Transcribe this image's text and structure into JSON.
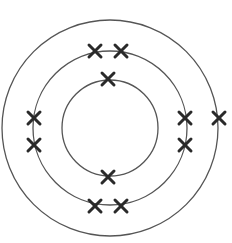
{
  "diagram": {
    "type": "bohr-model",
    "center": {
      "x": 110,
      "y": 128
    },
    "colors": {
      "shell": "#555555",
      "electron": "#2a2a2a",
      "background": "#ffffff"
    },
    "shells": [
      {
        "name": "shell-1",
        "radius": 48,
        "electron_count": 2,
        "electrons": [
          {
            "x": 108,
            "y": 79
          },
          {
            "x": 108,
            "y": 177
          }
        ]
      },
      {
        "name": "shell-2",
        "radius": 77,
        "electron_count": 8,
        "electrons": [
          {
            "x": 95,
            "y": 51
          },
          {
            "x": 121,
            "y": 51
          },
          {
            "x": 34,
            "y": 118
          },
          {
            "x": 34,
            "y": 145
          },
          {
            "x": 185,
            "y": 118
          },
          {
            "x": 185,
            "y": 145
          },
          {
            "x": 95,
            "y": 206
          },
          {
            "x": 121,
            "y": 206
          }
        ]
      },
      {
        "name": "shell-3",
        "radius": 108,
        "electron_count": 1,
        "electrons": [
          {
            "x": 219,
            "y": 118
          }
        ]
      }
    ],
    "electron_configuration": "2,8,1",
    "total_electrons": 11
  }
}
